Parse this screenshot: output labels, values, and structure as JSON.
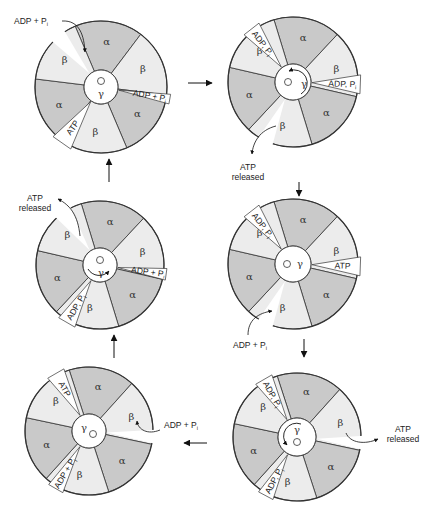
{
  "diagram": {
    "colors": {
      "alpha_fill": "#c9c9c9",
      "beta_fill": "#ececec",
      "site_fill": "#ffffff",
      "outline": "#333333",
      "arrow": "#111111",
      "background": "#ffffff"
    },
    "subunit_labels": {
      "alpha": "α",
      "beta": "β",
      "gamma": "γ"
    },
    "panels": [
      {
        "id": "panel-1",
        "annotations": [
          {
            "name": "adp-pi-entering",
            "text": "ADP + P",
            "subscript": "i"
          },
          {
            "name": "site-adp-pi",
            "text": "ADP + P",
            "subscript": "i"
          },
          {
            "name": "site-atp",
            "text": "ATP",
            "subscript": ""
          }
        ]
      },
      {
        "id": "panel-2",
        "annotations": [
          {
            "name": "site-adp-pi-top",
            "text": "ADP, P",
            "subscript": "i"
          },
          {
            "name": "site-adp-pi-right",
            "text": "ADP, P",
            "subscript": "i"
          },
          {
            "name": "atp-released",
            "text": "ATP",
            "line2": "released"
          }
        ]
      },
      {
        "id": "panel-3",
        "annotations": [
          {
            "name": "atp-released",
            "text": "ATP",
            "line2": "released"
          },
          {
            "name": "site-adp-pi-right",
            "text": "ADP + P",
            "subscript": "i"
          },
          {
            "name": "site-adp-pi-bottom",
            "text": "ADP, P",
            "subscript": "i"
          }
        ]
      },
      {
        "id": "panel-4",
        "annotations": [
          {
            "name": "site-adp-pi-top",
            "text": "ADP, P",
            "subscript": "i"
          },
          {
            "name": "site-atp",
            "text": "ATP",
            "subscript": ""
          },
          {
            "name": "adp-pi-entering",
            "text": "ADP + P",
            "subscript": "i"
          }
        ]
      },
      {
        "id": "panel-5",
        "annotations": [
          {
            "name": "site-atp",
            "text": "ATP",
            "subscript": ""
          },
          {
            "name": "adp-pi-entering",
            "text": "ADP + P",
            "subscript": "i"
          },
          {
            "name": "site-adp-pi-bottom",
            "text": "ADP + P",
            "subscript": "i"
          }
        ]
      },
      {
        "id": "panel-6",
        "annotations": [
          {
            "name": "site-adp-pi-top",
            "text": "ADP, P",
            "subscript": "i"
          },
          {
            "name": "site-adp-pi-bottom",
            "text": "ADP, P",
            "subscript": "i"
          },
          {
            "name": "atp-released",
            "text": "ATP",
            "line2": "released"
          }
        ]
      }
    ],
    "cycle_order": [
      "panel-1",
      "panel-2",
      "panel-4",
      "panel-6",
      "panel-5",
      "panel-3"
    ]
  }
}
